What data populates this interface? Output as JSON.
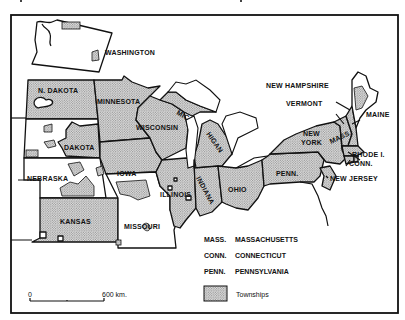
{
  "caption": "Figure (caption cut off at top of page)",
  "map": {
    "title": "",
    "state_labels": {
      "washington": "WASHINGTON",
      "n_dakota": "N. DAKOTA",
      "dakota": "DAKOTA",
      "nebraska": "NEBRASKA",
      "kansas": "KANSAS",
      "minnesota": "MINNESOTA",
      "iowa": "IOWA",
      "missouri": "MISSOURI",
      "wisconsin": "WISCONSIN",
      "illinois": "ILLINOIS",
      "michigan_a": "MIC",
      "michigan_b": "HIGAN",
      "indiana": "INDIANA",
      "ohio": "OHIO",
      "penn": "PENN.",
      "new_york_a": "NEW",
      "new_york_b": "YORK",
      "new_jersey": "NEW JERSEY",
      "new_hampshire": "NEW HAMPSHIRE",
      "vermont": "VERMONT",
      "maine": "MAINE",
      "mass": "MASS.",
      "rhode_island": "RHODE I.",
      "conn": "CONN."
    },
    "legend": {
      "abbreviations": [
        {
          "abbr": "MASS.",
          "name": "MASSACHUSETTS"
        },
        {
          "abbr": "CONN.",
          "name": "CONNECTICUT"
        },
        {
          "abbr": "PENN.",
          "name": "PENNSYLVANIA"
        }
      ],
      "swatch_label": "Townships"
    },
    "scale": {
      "start": "0",
      "end": "600 km."
    },
    "colors": {
      "ink": "#111111",
      "paper": "#ffffff",
      "stipple": "#bdbdbd"
    }
  }
}
